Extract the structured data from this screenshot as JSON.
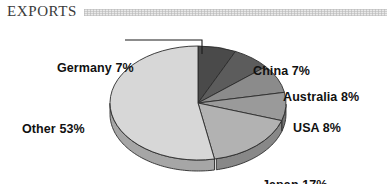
{
  "header": {
    "title": "EXPORTS",
    "rule_style": "textured-gray-band"
  },
  "chart_data": {
    "type": "pie",
    "title": "EXPORTS",
    "subtitle": "",
    "xlabel": "",
    "ylabel": "",
    "legend_position": "none",
    "labels_position": "around-slices",
    "three_d": true,
    "start_angle_deg": 0,
    "direction": "clockwise",
    "categories": [
      "Germany",
      "China",
      "Australia",
      "USA",
      "Japan",
      "Other"
    ],
    "values": [
      7,
      7,
      8,
      8,
      17,
      53
    ],
    "unit": "%",
    "total": 100,
    "slices": [
      {
        "name": "Germany",
        "value": 7,
        "label": "Germany 7%",
        "color": "#4a4a4a",
        "side_color": "#343434",
        "has_leader_line": true
      },
      {
        "name": "China",
        "value": 7,
        "label": "China 7%",
        "color": "#5c5c5c",
        "side_color": "#414141",
        "has_leader_line": false
      },
      {
        "name": "Australia",
        "value": 8,
        "label": "Australia 8%",
        "color": "#8b8b8b",
        "side_color": "#676767",
        "has_leader_line": false
      },
      {
        "name": "USA",
        "value": 8,
        "label": "USA 8%",
        "color": "#9a9a9a",
        "side_color": "#737373",
        "has_leader_line": false
      },
      {
        "name": "Japan",
        "value": 17,
        "label": "Japan 17%",
        "color": "#b2b2b2",
        "side_color": "#888888",
        "has_leader_line": false
      },
      {
        "name": "Other",
        "value": 53,
        "label": "Other 53%",
        "color": "#d7d7d7",
        "side_color": "#a6a6a6",
        "has_leader_line": false
      }
    ],
    "colors": {
      "background": "#ffffff",
      "outline": "#2b2b2b",
      "label_text": "#111111",
      "title_text": "#3a3a3a"
    }
  }
}
